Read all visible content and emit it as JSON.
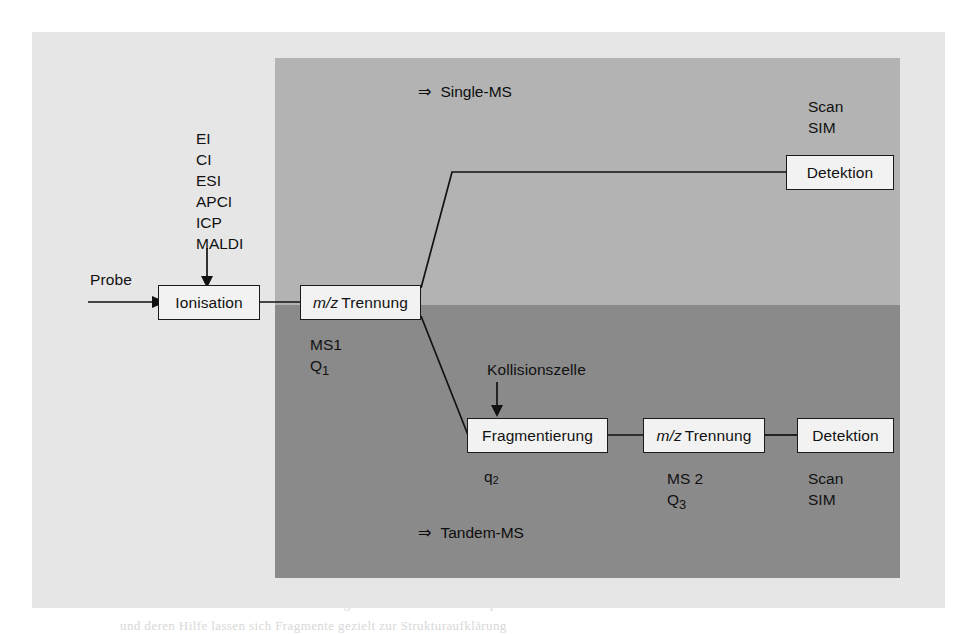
{
  "figure": {
    "title_hidden": "Mass spectrometry workflow schematic",
    "regions": [
      {
        "name": "single-ms",
        "tag_arrow": "⇒",
        "tag_label": "Single-MS",
        "color": "#b3b3b3"
      },
      {
        "name": "tandem-ms",
        "tag_arrow": "⇒",
        "tag_label": "Tandem-MS",
        "color": "#8a8a8a"
      }
    ],
    "sample": {
      "label": "Probe"
    },
    "ionisation": {
      "box_label": "Ionisation",
      "methods": [
        "EI",
        "CI",
        "ESI",
        "APCI",
        "ICP",
        "MALDI"
      ]
    },
    "ms1": {
      "box_prefix": "m/z",
      "box_label": "Trennung",
      "sub_line1": "MS1",
      "sub_line2": "Q",
      "sub_line2_sub": "1"
    },
    "single_ms_detector": {
      "box_label": "Detektion",
      "mode_line1": "Scan",
      "mode_line2": "SIM"
    },
    "collision_cell": {
      "label": "Kollisionszelle"
    },
    "fragmentation": {
      "box_label": "Fragmentierung",
      "sub_label": "q",
      "sub_label_sub": "2"
    },
    "ms2": {
      "box_prefix": "m/z",
      "box_label": "Trennung",
      "sub_line1": "MS 2",
      "sub_line2": "Q",
      "sub_line2_sub": "3"
    },
    "tandem_detector": {
      "box_label": "Detektion",
      "mode_line1": "Scan",
      "mode_line2": "SIM"
    },
    "ghost_text": {
      "g1": "Kapitel 5 · Grundlagen der Massenspektrometrie",
      "g2": "der  Analyt  wird  in  der  Ionenquelle",
      "g3": "ionisiert  und  anschließend  nach",
      "g4": "seinem  Masse-zu-Ladungs-Verhältnis",
      "g5": "getrennt.  Die  Detektion  erfolgt",
      "g6": "über  einen  Sekundärelektronen-",
      "g7": "vervielfacher  oder  einen  Faraday-",
      "g8": "Becher.  Bei  der  Tandem-Massen-",
      "g9": "spektrometrie  werden  zwei  Analysa-",
      "g10": "toren  hintereinander  geschaltet.",
      "g11": "Abb. 5.7  Schematischer Aufbau  von  Single-  und  Tandem-Massenspektrometern",
      "g12": "und  deren  Hilfe  lassen  sich  Fragmente  gezielt  zur  Strukturaufklärung"
    }
  }
}
